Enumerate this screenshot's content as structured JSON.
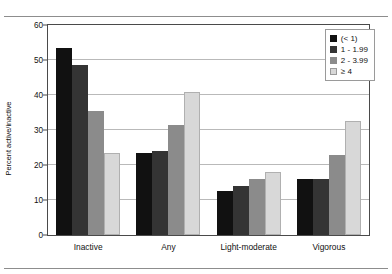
{
  "scan_artifact_text": "",
  "chart_data": {
    "type": "bar",
    "title": "",
    "subtitle": "",
    "xlabel": "",
    "ylabel": "Percent active/inactive",
    "categories": [
      "Inactive",
      "Any",
      "Light-moderate",
      "Vigorous"
    ],
    "ylim": [
      0,
      60
    ],
    "yticks": [
      0,
      10,
      20,
      30,
      40,
      50,
      60
    ],
    "grid": true,
    "legend_position": "top-right",
    "legend_title": "",
    "series": [
      {
        "name": "(< 1)",
        "color": "#111111",
        "values": [
          53.5,
          23.5,
          12.5,
          16.0
        ]
      },
      {
        "name": "1 - 1.99",
        "color": "#343434",
        "values": [
          48.5,
          24.0,
          14.0,
          16.0
        ]
      },
      {
        "name": "2 - 3.99",
        "color": "#8b8b8b",
        "values": [
          35.5,
          31.5,
          16.0,
          23.0
        ]
      },
      {
        "name": "≥ 4",
        "color": "#d8d8d8",
        "values": [
          23.5,
          41.0,
          18.0,
          32.5
        ]
      }
    ],
    "annotations": []
  },
  "axis": {
    "ytick_labels": [
      "0",
      "10",
      "20",
      "30",
      "40",
      "50",
      "60"
    ]
  }
}
